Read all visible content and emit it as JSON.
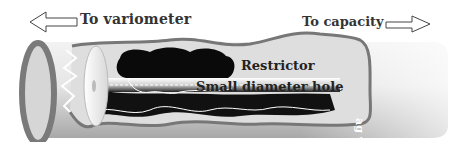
{
  "diagram": {
    "labels": {
      "to_variometer": "To variometer",
      "to_capacity": "To capacity",
      "restrictor": "Restrictor",
      "small_hole": "Small diameter hole",
      "bag_wall": "ag wall"
    },
    "arrows": [
      {
        "name": "arrow-left",
        "direction": "left",
        "target": "To variometer"
      },
      {
        "name": "arrow-right",
        "direction": "right",
        "target": "To capacity"
      }
    ],
    "colors": {
      "tube": "#bdbdbd",
      "tube_rim": "#7a7a7a",
      "restrictor": "#111111",
      "background": "#ffffff"
    }
  }
}
